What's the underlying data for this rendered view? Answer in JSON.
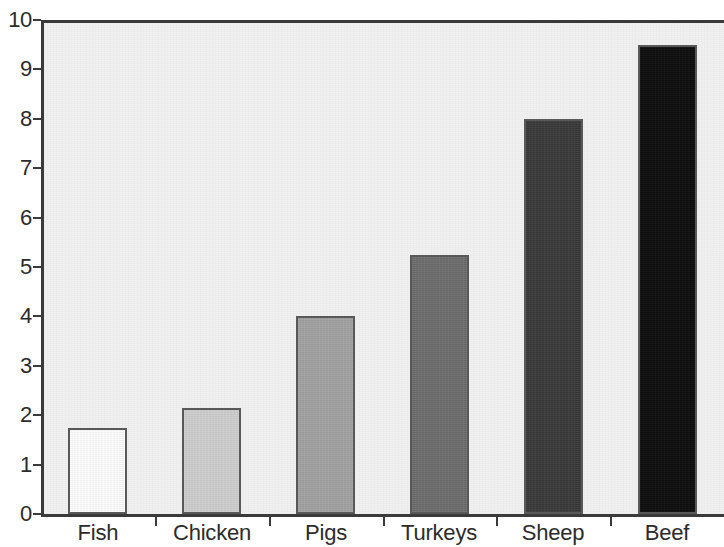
{
  "chart_data": {
    "type": "bar",
    "title": "",
    "subtitle": "",
    "xlabel": "",
    "ylabel": "",
    "categories": [
      "Fish",
      "Chicken",
      "Pigs",
      "Turkeys",
      "Sheep",
      "Beef"
    ],
    "values": [
      1.75,
      2.15,
      4.0,
      5.25,
      8.0,
      9.5
    ],
    "series": [
      {
        "name": "",
        "values": [
          1.75,
          2.15,
          4.0,
          5.25,
          8.0,
          9.5
        ]
      }
    ],
    "bar_colors": [
      "#ffffff",
      "#d0d0d0",
      "#a3a3a3",
      "#6e6e6e",
      "#3a3a3a",
      "#0d0d0d"
    ],
    "bar_edge_color": "#585858",
    "ylim": [
      0,
      10
    ],
    "yticks": [
      0,
      1,
      2,
      3,
      4,
      5,
      6,
      7,
      8,
      9,
      10
    ],
    "ytick_labels": [
      "0",
      "1",
      "2",
      "3",
      "4",
      "5",
      "6",
      "7",
      "8",
      "9",
      "10"
    ],
    "grid": false,
    "legend": null,
    "legend_position": "none",
    "plot_background": "#f1f1f1",
    "page_background": "#ffffff",
    "axis_color": "#3a3a3a",
    "annotations": []
  },
  "axis": {
    "y_top_label": "10",
    "y_bottom_label": "0"
  }
}
